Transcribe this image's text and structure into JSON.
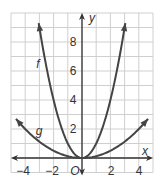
{
  "chart_data": {
    "type": "line",
    "title": "",
    "xlabel": "x",
    "ylabel": "y",
    "origin_label": "O",
    "xlim": [
      -5,
      5
    ],
    "ylim": [
      -1,
      10
    ],
    "grid": true,
    "x_ticks": [
      -4,
      -2,
      2,
      4
    ],
    "x_tick_labels": [
      "−4",
      "−2",
      "2",
      "4"
    ],
    "y_ticks": [
      2,
      4,
      6,
      8
    ],
    "y_tick_labels": [
      "2",
      "4",
      "6",
      "8"
    ],
    "series": [
      {
        "name": "f",
        "label": "f",
        "equation": "y = x^2",
        "x": [
          -3.1,
          -3,
          -2,
          -1,
          0,
          1,
          2,
          3,
          3.1
        ],
        "values": [
          9.61,
          9,
          4,
          1,
          0,
          1,
          4,
          9,
          9.61
        ]
      },
      {
        "name": "g",
        "label": "g",
        "equation": "y = x^2/8",
        "x": [
          -4.7,
          -4,
          -2,
          0,
          2,
          4,
          4.7
        ],
        "values": [
          2.76,
          2,
          0.5,
          0,
          0.5,
          2,
          2.76
        ]
      }
    ],
    "colors": {
      "curve": "#444444",
      "axis": "#333333",
      "grid": "#cfcfcf"
    }
  }
}
